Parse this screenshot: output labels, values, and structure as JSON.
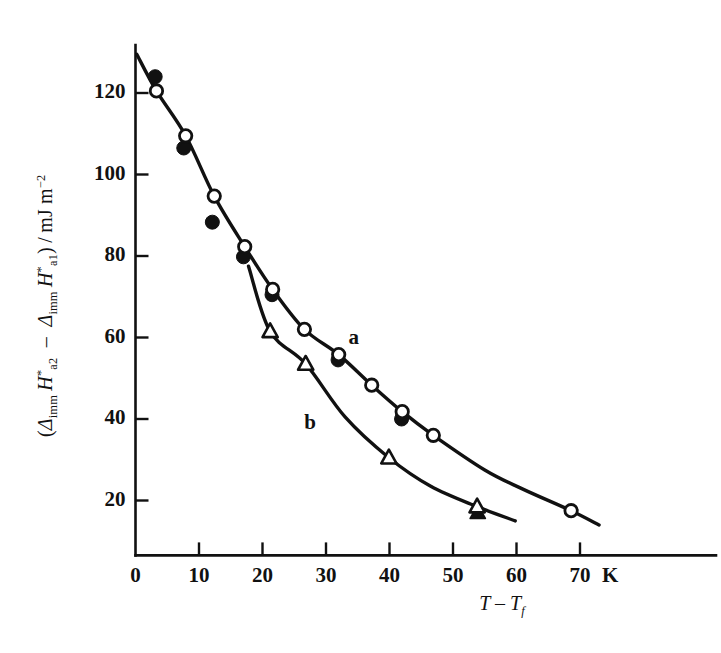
{
  "figure": {
    "background_color": "#ffffff",
    "ink_color": "#111111"
  },
  "axes": {
    "x": {
      "label_plain": "T - T_f",
      "label_main": "T",
      "label_minus": "–",
      "label_second": "T",
      "label_second_sub": "f",
      "unit": "K",
      "ticks": [
        0,
        10,
        20,
        30,
        40,
        50,
        60,
        70
      ],
      "tick_labels": [
        "0",
        "10",
        "20",
        "30",
        "40",
        "50",
        "60",
        "70"
      ],
      "range": [
        0,
        73
      ]
    },
    "y": {
      "label_plain": "(Δimm H*a2 – Δimm H*a1) / mJ m-2",
      "parts": {
        "open_paren": "(",
        "delta1": "Δ",
        "delta1_sub": "imm",
        "h1": "H",
        "h1_sup": "*",
        "h1_sub": "a2",
        "minus": "–",
        "delta2": "Δ",
        "delta2_sub": "imm",
        "h2": "H",
        "h2_sup": "*",
        "h2_sub": "a1",
        "close_paren": ")",
        "slash": "/",
        "units": "mJ m",
        "units_sup": "−2"
      },
      "ticks": [
        20,
        40,
        60,
        80,
        100,
        120
      ],
      "tick_labels": [
        "20",
        "40",
        "60",
        "80",
        "100",
        "120"
      ],
      "range": [
        8,
        133
      ]
    }
  },
  "annotations": [
    {
      "text": "a",
      "x": 34.5,
      "y": 59.5
    },
    {
      "text": "b",
      "x": 27.5,
      "y": 38.5
    }
  ],
  "chart_data": {
    "type": "scatter",
    "title": "",
    "xlabel": "T – T_f / K",
    "ylabel": "(Δ_imm H*_a2 – Δ_imm H*_a1) / mJ m⁻²",
    "xlim": [
      0,
      73
    ],
    "ylim": [
      8,
      133
    ],
    "grid": false,
    "legend": "inline-labels",
    "series": [
      {
        "name": "a",
        "marker": "circle-open",
        "curve": true,
        "points": [
          {
            "x": 3.3,
            "y": 120.5
          },
          {
            "x": 7.9,
            "y": 109.5
          },
          {
            "x": 12.4,
            "y": 94.7
          },
          {
            "x": 17.2,
            "y": 82.3
          },
          {
            "x": 21.6,
            "y": 71.8
          },
          {
            "x": 26.6,
            "y": 62.0
          },
          {
            "x": 32.0,
            "y": 55.8
          },
          {
            "x": 37.2,
            "y": 48.3
          },
          {
            "x": 42.0,
            "y": 41.8
          },
          {
            "x": 46.9,
            "y": 36.0
          },
          {
            "x": 68.6,
            "y": 17.5
          }
        ]
      },
      {
        "name": "a-filled",
        "marker": "circle-filled",
        "curve": false,
        "points": [
          {
            "x": 3.1,
            "y": 124.0
          },
          {
            "x": 7.6,
            "y": 106.5
          },
          {
            "x": 12.1,
            "y": 88.3
          },
          {
            "x": 17.0,
            "y": 79.8
          },
          {
            "x": 21.5,
            "y": 70.5
          },
          {
            "x": 31.9,
            "y": 54.5
          },
          {
            "x": 41.9,
            "y": 40.0
          }
        ]
      },
      {
        "name": "b",
        "marker": "triangle-open",
        "curve": true,
        "points": [
          {
            "x": 21.2,
            "y": 61.5
          },
          {
            "x": 26.8,
            "y": 53.5
          },
          {
            "x": 39.9,
            "y": 30.5
          },
          {
            "x": 53.8,
            "y": 18.5
          }
        ]
      },
      {
        "name": "b-filled",
        "marker": "triangle-filled",
        "curve": false,
        "points": [
          {
            "x": 53.9,
            "y": 17.0
          }
        ]
      }
    ],
    "curve_a_path": [
      {
        "x": 0.2,
        "y": 129.5
      },
      {
        "x": 3.3,
        "y": 120.5
      },
      {
        "x": 7.9,
        "y": 109.5
      },
      {
        "x": 12.4,
        "y": 94.7
      },
      {
        "x": 17.2,
        "y": 82.3
      },
      {
        "x": 21.6,
        "y": 71.8
      },
      {
        "x": 26.6,
        "y": 62.0
      },
      {
        "x": 32.0,
        "y": 55.8
      },
      {
        "x": 37.2,
        "y": 48.3
      },
      {
        "x": 42.0,
        "y": 41.8
      },
      {
        "x": 46.9,
        "y": 36.0
      },
      {
        "x": 55.0,
        "y": 27.5
      },
      {
        "x": 61.0,
        "y": 22.8
      },
      {
        "x": 68.6,
        "y": 17.5
      },
      {
        "x": 73.0,
        "y": 14.0
      }
    ],
    "curve_b_path": [
      {
        "x": 17.8,
        "y": 77.5
      },
      {
        "x": 21.2,
        "y": 61.5
      },
      {
        "x": 26.8,
        "y": 53.5
      },
      {
        "x": 33.0,
        "y": 40.5
      },
      {
        "x": 39.9,
        "y": 30.5
      },
      {
        "x": 46.5,
        "y": 23.5
      },
      {
        "x": 53.8,
        "y": 18.5
      },
      {
        "x": 59.8,
        "y": 15.0
      }
    ]
  }
}
